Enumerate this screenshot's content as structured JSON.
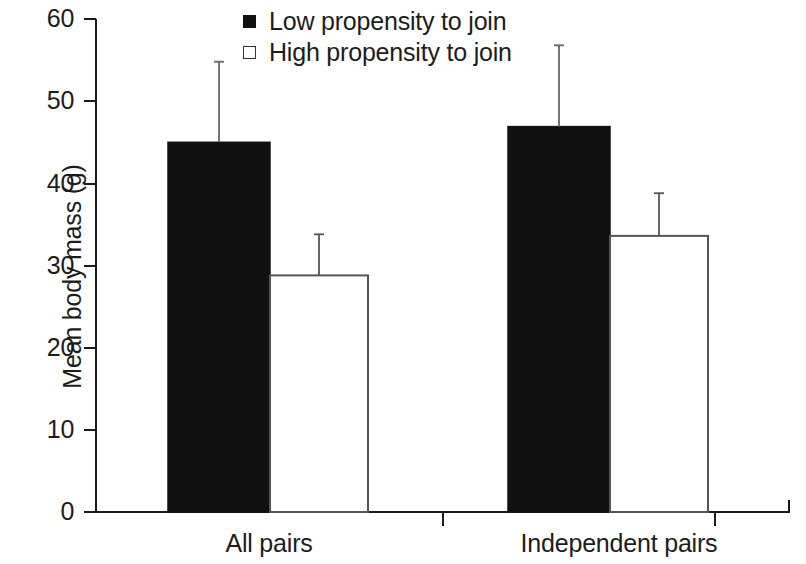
{
  "chart_data": {
    "type": "bar",
    "title": "",
    "subtitle": "",
    "xlabel": "",
    "ylabel": "Mean body mass (g)",
    "categories": [
      "All pairs",
      "Independent pairs"
    ],
    "ylim": [
      0,
      60
    ],
    "yticks": [
      0,
      10,
      20,
      30,
      40,
      50,
      60
    ],
    "ytick_labels": [
      "0",
      "10",
      "20",
      "30",
      "40",
      "50",
      "60"
    ],
    "grid": false,
    "legend_position": "top-center",
    "error_bars": "upper only (SD)",
    "series": [
      {
        "name": "Low propensity to join",
        "style": "filled",
        "color": "#111111",
        "values": [
          45.0,
          46.9
        ],
        "error_upper": [
          54.8,
          56.8
        ]
      },
      {
        "name": "High propensity to join",
        "style": "open",
        "color": "#ffffff",
        "values": [
          28.8,
          33.6
        ],
        "error_upper": [
          33.8,
          38.8
        ]
      }
    ]
  },
  "legend": {
    "items": [
      {
        "label": "Low propensity to join",
        "swatch": "filled-square"
      },
      {
        "label": "High propensity to join",
        "swatch": "open-square"
      }
    ]
  },
  "axes": {
    "y_title": "Mean body mass (g)",
    "y_tick_0": "0",
    "y_tick_1": "10",
    "y_tick_2": "20",
    "y_tick_3": "30",
    "y_tick_4": "40",
    "y_tick_5": "50",
    "y_tick_6": "60",
    "x_cat_0": "All pairs",
    "x_cat_1": "Independent pairs"
  },
  "colors": {
    "axis": "#1a1a1a",
    "bar_filled": "#111111",
    "bar_open_stroke": "#555555",
    "error_bar": "#666666",
    "background": "#ffffff"
  }
}
